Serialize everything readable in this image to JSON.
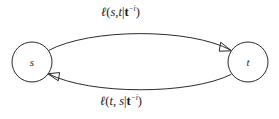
{
  "figure": {
    "type": "directed-graph",
    "background_color": "#ffffff",
    "stroke_color": "#2b2b2b",
    "text_color": "#1a1a1a"
  },
  "nodes": [
    {
      "id": "s",
      "label": "s",
      "cx": 32,
      "cy": 62,
      "r": 20
    },
    {
      "id": "t",
      "label": "t",
      "cx": 248,
      "cy": 62,
      "r": 20
    }
  ],
  "edges": [
    {
      "id": "s-to-t",
      "from": "s",
      "to": "t",
      "direction": "right",
      "label": {
        "full_text": "ℓ(s,t|t⁻ⁱ)",
        "fn": "ℓ",
        "open_paren": "(",
        "arg1": "s",
        "comma": ",",
        "arg2": "t",
        "bar": "|",
        "cond_base": "t",
        "cond_sup": "−i",
        "close_paren": ")"
      }
    },
    {
      "id": "t-to-s",
      "from": "t",
      "to": "s",
      "direction": "left",
      "label": {
        "full_text": "ℓ(t, s|t⁻ⁱ)",
        "fn": "ℓ",
        "open_paren": "(",
        "arg1": "t",
        "comma": ", ",
        "arg2": "s",
        "bar": "|",
        "cond_base": "t",
        "cond_sup": "−i",
        "close_paren": ")"
      }
    }
  ]
}
